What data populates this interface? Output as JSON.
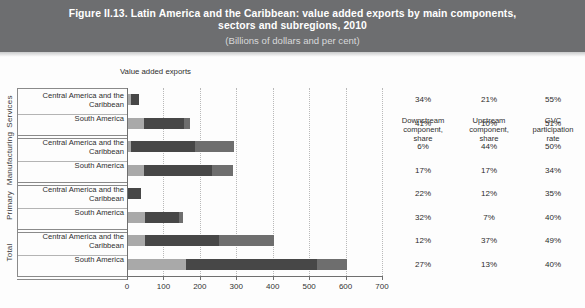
{
  "title": {
    "line1": "Figure II.13. Latin America and the Caribbean: value added exports by main components,",
    "line2": "sectors and subregions, 2010",
    "subtitle": "(Billions of dollars and per cent)"
  },
  "plot_label": "Value added exports",
  "columns": {
    "downstream": "Downstream component, share",
    "downstream_l1": "Downstream",
    "downstream_l2": "component,",
    "downstream_l3": "share",
    "upstream_l1": "Upstream",
    "upstream_l2": "component,",
    "upstream_l3": "share",
    "gvc_l1": "GVC",
    "gvc_l2": "participation",
    "gvc_l3": "rate"
  },
  "groups": [
    {
      "name": "Services"
    },
    {
      "name": "Manufacturing"
    },
    {
      "name": "Primary"
    },
    {
      "name": "Total"
    }
  ],
  "colors": {
    "band": "#6d6e70",
    "domestic": "#a9a9a9",
    "foreign": "#474747",
    "downstream": "#6e6e6e"
  },
  "chart_data": {
    "type": "bar",
    "orientation": "horizontal",
    "stacked": true,
    "title": "Figure II.13. Latin America and the Caribbean: value added exports by main components, sectors and subregions, 2010",
    "subtitle": "(Billions of dollars and per cent)",
    "xlabel": "Value added exports",
    "ylabel": "",
    "xlim": [
      0,
      700
    ],
    "xticks": [
      0,
      100,
      200,
      300,
      400,
      500,
      600,
      700
    ],
    "grid": true,
    "legend": "none",
    "segment_names": [
      "segment-1",
      "segment-2",
      "segment-3"
    ],
    "rows": [
      {
        "group": "Services",
        "subregion": "Central America and the Caribbean",
        "segments": [
          8,
          22,
          0
        ],
        "total": 30,
        "downstream_share": "34%",
        "upstream_share": "21%",
        "gvc_rate": "55%"
      },
      {
        "group": "Services",
        "subregion": "South America",
        "segments": [
          45,
          110,
          15
        ],
        "total": 170,
        "downstream_share": "41%",
        "upstream_share": "10%",
        "gvc_rate": "51%"
      },
      {
        "group": "Manufacturing",
        "subregion": "Central America and the Caribbean",
        "segments": [
          8,
          177,
          105
        ],
        "total": 290,
        "downstream_share": "6%",
        "upstream_share": "44%",
        "gvc_rate": "50%"
      },
      {
        "group": "Manufacturing",
        "subregion": "South America",
        "segments": [
          45,
          185,
          58
        ],
        "total": 288,
        "downstream_share": "17%",
        "upstream_share": "17%",
        "gvc_rate": "34%"
      },
      {
        "group": "Primary",
        "subregion": "Central America and the Caribbean",
        "segments": [
          0,
          35,
          0
        ],
        "total": 35,
        "downstream_share": "22%",
        "upstream_share": "12%",
        "gvc_rate": "35%"
      },
      {
        "group": "Primary",
        "subregion": "South America",
        "segments": [
          48,
          92,
          10
        ],
        "total": 150,
        "downstream_share": "32%",
        "upstream_share": "7%",
        "gvc_rate": "40%"
      },
      {
        "group": "Total",
        "subregion": "Central America and the Caribbean",
        "segments": [
          48,
          202,
          150
        ],
        "total": 400,
        "downstream_share": "12%",
        "upstream_share": "37%",
        "gvc_rate": "49%"
      },
      {
        "group": "Total",
        "subregion": "South America",
        "segments": [
          160,
          360,
          80
        ],
        "total": 600,
        "downstream_share": "27%",
        "upstream_share": "13%",
        "gvc_rate": "40%"
      }
    ]
  }
}
